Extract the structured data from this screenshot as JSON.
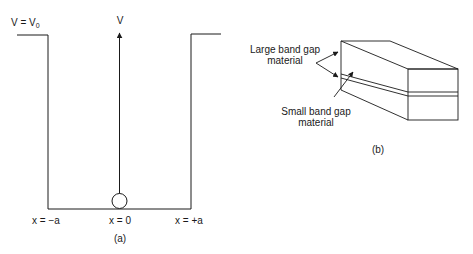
{
  "panel_a": {
    "v0_label": "V = V",
    "v0_sub": "0",
    "axis_label": "V",
    "x_left_label": "x = −a",
    "x_center_label": "x = 0",
    "x_right_label": "x = +a",
    "caption": "(a)"
  },
  "panel_b": {
    "large_gap_label_line1": "Large band gap",
    "large_gap_label_line2": "material",
    "small_gap_label_line1": "Small band gap",
    "small_gap_label_line2": "material",
    "caption": "(b)"
  },
  "colors": {
    "line": "#1a1a1a",
    "background": "#ffffff"
  }
}
